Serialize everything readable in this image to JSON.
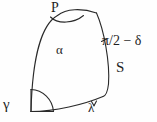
{
  "figure": {
    "type": "geometry-diagram",
    "background_color": "#fefefe",
    "stroke_color": "#2a2a2a",
    "stroke_width": 1.1,
    "width": 157,
    "height": 122,
    "labels": {
      "vertex_top": "P",
      "interior_angle": "α",
      "right_angle_expression": "π/2 − δ",
      "right_side": "S",
      "bottom_left_angle": "γ",
      "bottom_angle": "λ"
    },
    "angle_markers": [
      {
        "name": "arc-at-P",
        "at_label": "P"
      },
      {
        "name": "arc-at-bottom-left",
        "at_label": "γ"
      },
      {
        "name": "tick-at-bottom",
        "at_label": "λ"
      },
      {
        "name": "tick-at-right",
        "at_label": "π/2 − δ"
      }
    ]
  }
}
